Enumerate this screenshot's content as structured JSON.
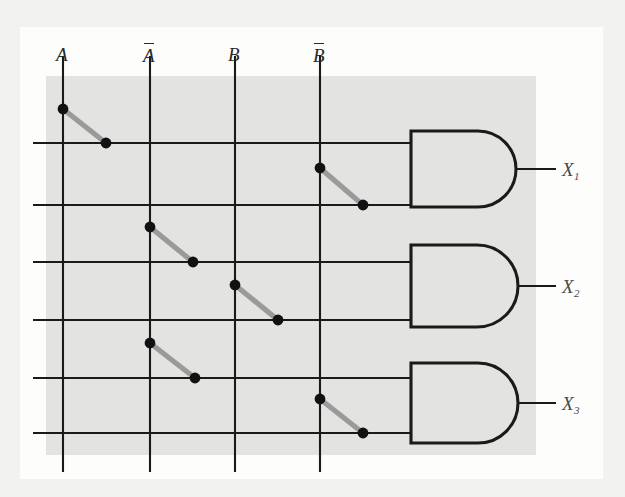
{
  "diagram": {
    "background_color": "#e3e3e1",
    "page_color": "#fdfdfc",
    "line_color": "#1a1a1a",
    "fuse_color": "#9a9a9a",
    "dot_color": "#111111",
    "inputs": [
      {
        "id": "A",
        "label": "A",
        "overline": false,
        "x": 63
      },
      {
        "id": "An",
        "label": "A",
        "overline": true,
        "x": 150
      },
      {
        "id": "B",
        "label": "B",
        "overline": false,
        "x": 235
      },
      {
        "id": "Bn",
        "label": "B",
        "overline": true,
        "x": 320
      }
    ],
    "input_label_y": 45,
    "vertical_line": {
      "y_top": 56,
      "y_bottom": 472
    },
    "product_lines": [
      {
        "index": 1,
        "y": 143
      },
      {
        "index": 2,
        "y": 205
      },
      {
        "index": 3,
        "y": 262
      },
      {
        "index": 4,
        "y": 320
      },
      {
        "index": 5,
        "y": 378
      },
      {
        "index": 6,
        "y": 433
      }
    ],
    "horizontal_line": {
      "x_start": 33,
      "x_end": 411
    },
    "fuses": [
      {
        "id": "fuse-1",
        "input": "A",
        "row": 1,
        "from_x": 63,
        "from_y": 109,
        "to_x": 106,
        "to_y": 143
      },
      {
        "id": "fuse-2",
        "input": "Bn",
        "row": 2,
        "from_x": 320,
        "from_y": 168,
        "to_x": 363,
        "to_y": 205
      },
      {
        "id": "fuse-3",
        "input": "An",
        "row": 3,
        "from_x": 150,
        "from_y": 227,
        "to_x": 193,
        "to_y": 262
      },
      {
        "id": "fuse-4",
        "input": "B",
        "row": 4,
        "from_x": 235,
        "from_y": 285,
        "to_x": 278,
        "to_y": 320
      },
      {
        "id": "fuse-5",
        "input": "An",
        "row": 5,
        "from_x": 150,
        "from_y": 343,
        "to_x": 195,
        "to_y": 378
      },
      {
        "id": "fuse-6",
        "input": "Bn",
        "row": 6,
        "from_x": 320,
        "from_y": 399,
        "to_x": 363,
        "to_y": 433
      }
    ],
    "gates": [
      {
        "id": "gate-1",
        "type": "AND",
        "x": 411,
        "y_top": 131,
        "y_bottom": 207,
        "tip_x": 516,
        "out_y": 169,
        "out_x_end": 556
      },
      {
        "id": "gate-2",
        "type": "AND",
        "x": 411,
        "y_top": 245,
        "y_bottom": 327,
        "tip_x": 518,
        "out_y": 286,
        "out_x_end": 556
      },
      {
        "id": "gate-3",
        "type": "AND",
        "x": 411,
        "y_top": 363,
        "y_bottom": 443,
        "tip_x": 518,
        "out_y": 403,
        "out_x_end": 556
      }
    ],
    "outputs": [
      {
        "id": "X1",
        "base": "X",
        "sub": "1",
        "x": 562,
        "y": 160
      },
      {
        "id": "X2",
        "base": "X",
        "sub": "2",
        "x": 562,
        "y": 277
      },
      {
        "id": "X3",
        "base": "X",
        "sub": "3",
        "x": 562,
        "y": 394
      }
    ]
  }
}
